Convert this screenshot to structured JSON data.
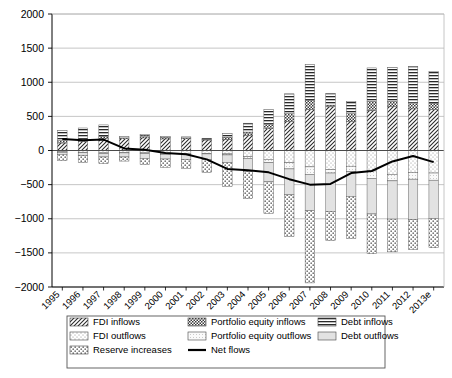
{
  "chart_data": {
    "type": "bar",
    "title": "",
    "subtitle": "",
    "xlabel": "",
    "ylabel": "",
    "ylim": [
      -2000,
      2000
    ],
    "ytick_labels": [
      "2000",
      "1500",
      "1000",
      "500",
      "0",
      "-500",
      "-1000",
      "-1500",
      "-2000"
    ],
    "ytick_values": [
      2000,
      1500,
      1000,
      500,
      0,
      -500,
      -1000,
      -1500,
      -2000
    ],
    "grid": true,
    "stacked": true,
    "legend_position": "bottom",
    "categories": [
      "1995",
      "1996",
      "1997",
      "1998",
      "1999",
      "2000",
      "2001",
      "2002",
      "2003",
      "2004",
      "2005",
      "2006",
      "2007",
      "2008",
      "2009",
      "2010",
      "2011",
      "2012",
      "2013e"
    ],
    "series": [
      {
        "name": "FDI inflows",
        "pattern": "diagonal-hatch-dark",
        "values": [
          110,
          135,
          175,
          175,
          185,
          170,
          175,
          155,
          165,
          225,
          320,
          430,
          600,
          640,
          430,
          590,
          650,
          610,
          600
        ]
      },
      {
        "name": "Portfolio equity inflows",
        "pattern": "checker-dark",
        "values": [
          35,
          35,
          30,
          10,
          40,
          25,
          10,
          10,
          30,
          45,
          70,
          110,
          140,
          25,
          110,
          130,
          70,
          90,
          95
        ]
      },
      {
        "name": "Debt inflows",
        "pattern": "horizontal-lines",
        "values": [
          150,
          160,
          170,
          20,
          10,
          10,
          15,
          15,
          55,
          130,
          210,
          290,
          520,
          170,
          180,
          490,
          500,
          530,
          460
        ]
      },
      {
        "name": "FDI outflows",
        "pattern": "light-dots",
        "values": [
          -20,
          -25,
          -35,
          -30,
          -35,
          -45,
          -45,
          -40,
          -50,
          -90,
          -130,
          -180,
          -240,
          -280,
          -230,
          -300,
          -350,
          -320,
          -330
        ]
      },
      {
        "name": "Portfolio equity outflows",
        "pattern": "fine-dots",
        "values": [
          -5,
          -5,
          -10,
          -5,
          -10,
          -10,
          -10,
          -10,
          -15,
          -25,
          -50,
          -90,
          -110,
          -50,
          -80,
          -110,
          -95,
          -100,
          -105
        ]
      },
      {
        "name": "Debt outflows",
        "pattern": "light-gray-solid",
        "values": [
          -30,
          -40,
          -50,
          -60,
          -70,
          -70,
          -75,
          -80,
          -110,
          -190,
          -280,
          -380,
          -530,
          -560,
          -360,
          -520,
          -560,
          -590,
          -560
        ]
      },
      {
        "name": "Reserve increases",
        "pattern": "coarse-dots",
        "values": [
          -95,
          -105,
          -95,
          -60,
          -90,
          -120,
          -130,
          -190,
          -350,
          -400,
          -460,
          -610,
          -1060,
          -430,
          -620,
          -580,
          -480,
          -440,
          -430
        ]
      }
    ],
    "line_series": {
      "name": "Net flows",
      "color": "#000000",
      "values": [
        170,
        150,
        160,
        30,
        10,
        -35,
        -55,
        -130,
        -270,
        -290,
        -320,
        -420,
        -500,
        -490,
        -330,
        -300,
        -160,
        -80,
        -170
      ]
    },
    "legend": [
      {
        "label": "FDI inflows",
        "pattern": "diagonal-hatch-dark"
      },
      {
        "label": "Portfolio equity inflows",
        "pattern": "checker-dark"
      },
      {
        "label": "Debt inflows",
        "pattern": "horizontal-lines"
      },
      {
        "label": "FDI outflows",
        "pattern": "light-dots"
      },
      {
        "label": "Portfolio equity outflows",
        "pattern": "fine-dots"
      },
      {
        "label": "Debt outflows",
        "pattern": "light-gray-solid"
      },
      {
        "label": "Reserve increases",
        "pattern": "coarse-dots"
      },
      {
        "label": "Net flows",
        "pattern": "line"
      }
    ]
  },
  "colors": {
    "axis": "#000000",
    "grid": "#b8b8b8",
    "line": "#000000",
    "frame": "#999999",
    "background": "#ffffff"
  }
}
